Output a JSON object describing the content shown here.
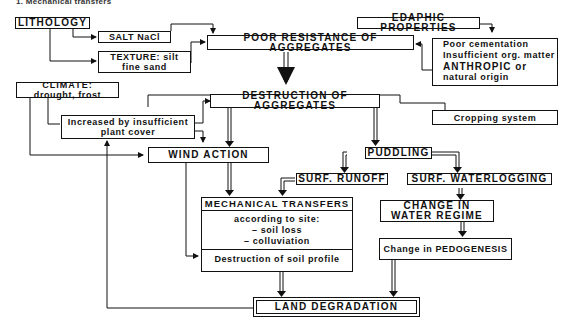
{
  "header": {
    "title": "1. Mechanical transfers"
  },
  "nodes": {
    "lithology": "LITHOLOGY",
    "salt": "SALT NaCl",
    "texture_1": "TEXTURE: silt",
    "texture_2": "fine sand",
    "edaphic": "EDAPHIC PROPERTIES",
    "poor_resistance": "POOR RESISTANCE OF AGGREGATES",
    "edaphic_details": [
      "Poor cementation",
      "Insufficient org. matter",
      "ANTHROPIC or",
      "natural origin"
    ],
    "climate_1": "CLIMATE:",
    "climate_2": "drought, frost",
    "destruction_agg": "DESTRUCTION OF AGGREGATES",
    "increased_1": "Increased by insufficient",
    "increased_2": "plant cover",
    "cropping": "Cropping system",
    "wind": "WIND ACTION",
    "puddling": "PUDDLING",
    "runoff": "SURF. RUNOFF",
    "waterlogging": "SURF. WATERLOGGING",
    "mech_title": "MECHANICAL TRANSFERS",
    "mech_lines": [
      "according to site:",
      "– soil loss",
      "– colluviation"
    ],
    "mech_foot": "Destruction of soil profile",
    "water_regime_1": "CHANGE IN",
    "water_regime_2": "WATER REGIME",
    "pedogenesis": "Change in PEDOGENESIS",
    "land_degradation": "LAND DEGRADATION"
  }
}
